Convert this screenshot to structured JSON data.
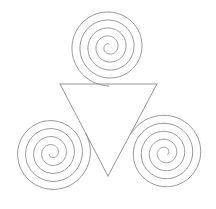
{
  "figure": {
    "background_color": "#ffffff",
    "stroke_color": "#8a8a8a",
    "stroke_width": 0.9,
    "canvas": {
      "width": 216,
      "height": 209
    },
    "symmetry": "3-fold rotational (C3)",
    "center": {
      "x": 108,
      "y": 116
    },
    "triangle": {
      "name": "inner-triangle",
      "vertices": [
        {
          "label": "top-left-vertex",
          "x": 60,
          "y": 84
        },
        {
          "label": "top-right-vertex",
          "x": 157,
          "y": 84
        },
        {
          "label": "bottom-vertex",
          "x": 108,
          "y": 176
        }
      ],
      "orientation": "point-down"
    },
    "spirals": [
      {
        "name": "top-spiral",
        "center": {
          "x": 109,
          "y": 47
        },
        "turns": 4.5,
        "start_radius": 3,
        "end_radius": 38,
        "growth_per_turn": 8,
        "start_angle_deg": 90,
        "direction": "counterclockwise",
        "opens_toward": "down"
      },
      {
        "name": "bottom-left-spiral",
        "center": {
          "x": 52,
          "y": 153
        },
        "turns": 4.5,
        "start_radius": 3,
        "end_radius": 38,
        "growth_per_turn": 8,
        "start_angle_deg": 210,
        "direction": "counterclockwise",
        "opens_toward": "upper-right"
      },
      {
        "name": "bottom-right-spiral",
        "center": {
          "x": 165,
          "y": 153
        },
        "turns": 4.5,
        "start_radius": 3,
        "end_radius": 38,
        "growth_per_turn": 8,
        "start_angle_deg": 330,
        "direction": "counterclockwise",
        "opens_toward": "upper-left"
      }
    ],
    "bounds": {
      "left": 17,
      "right": 200,
      "top": 11,
      "bottom": 192
    }
  }
}
